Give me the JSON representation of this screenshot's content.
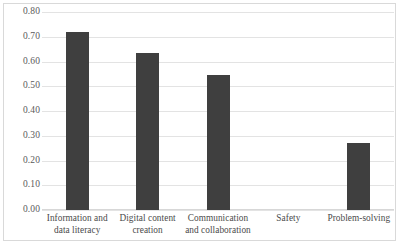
{
  "chart_data": {
    "type": "bar",
    "title": "",
    "subtitle": "",
    "xlabel": "",
    "ylabel": "",
    "categories": [
      "Information and data literacy",
      "Digital content creation",
      "Communication and collaboration",
      "Safety",
      "Problem-solving"
    ],
    "category_lines": [
      [
        "Information and",
        "data literacy"
      ],
      [
        "Digital content",
        "creation"
      ],
      [
        "Communication",
        "and collaboration"
      ],
      [
        "Safety"
      ],
      [
        "Problem-solving"
      ]
    ],
    "values": [
      0.72,
      0.635,
      0.545,
      0.0,
      0.27
    ],
    "ylim": [
      0.0,
      0.8
    ],
    "ytick_step": 0.1,
    "ytick_labels": [
      "0.80",
      "0.70",
      "0.60",
      "0.50",
      "0.40",
      "0.30",
      "0.20",
      "0.10",
      "0.00"
    ],
    "ytick_values": [
      0.8,
      0.7,
      0.6,
      0.5,
      0.4,
      0.3,
      0.2,
      0.1,
      0.0
    ],
    "grid": true,
    "legend": false,
    "legend_position": "none",
    "bar_color": "#3f3f3f",
    "gridline_color": "#e3e3e3",
    "frame_color": "#d9d9d9",
    "background_color": "#ffffff"
  }
}
